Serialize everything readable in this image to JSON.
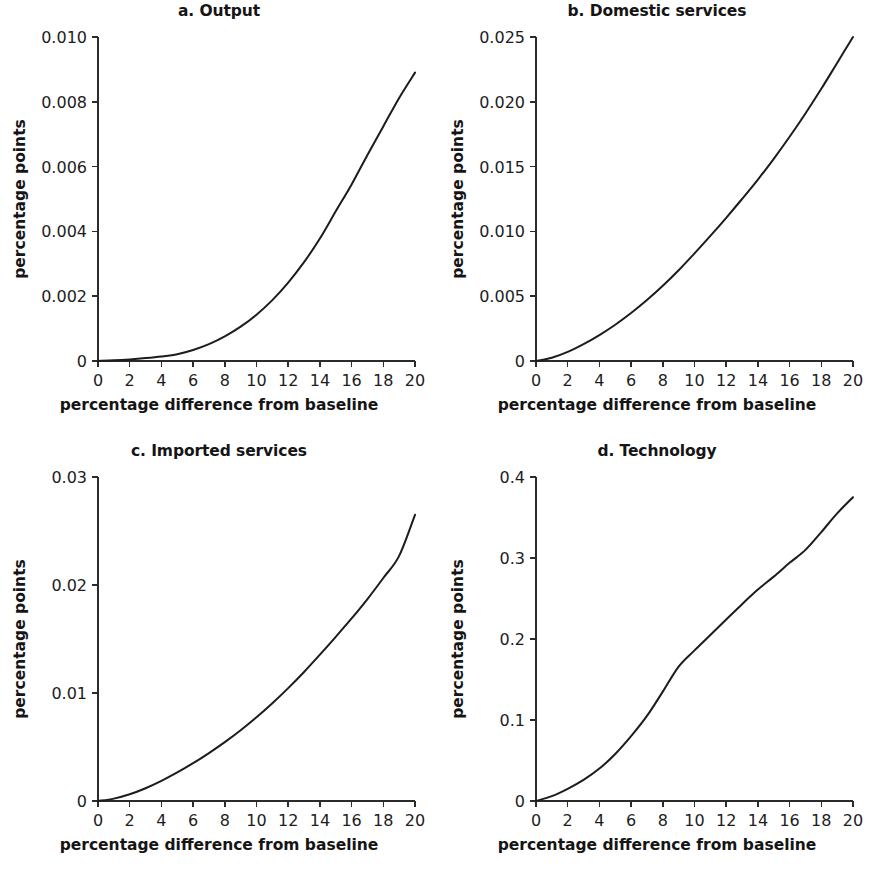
{
  "figure": {
    "background": "#ffffff",
    "line_color": "#1c1c1c",
    "axis_color": "#2b2b2b",
    "panel_count": 4
  },
  "chart_data": [
    {
      "type": "line",
      "title": "a. Output",
      "panel_letter": "a.",
      "panel_name": "Output",
      "xlabel": "percentage difference from baseline",
      "ylabel": "percentage points",
      "xlim": [
        0,
        20
      ],
      "ylim": [
        0,
        0.01
      ],
      "grid": false,
      "legend": "none",
      "xticks": [
        0,
        2,
        4,
        6,
        8,
        10,
        12,
        14,
        16,
        18,
        20
      ],
      "xticklabels": [
        "0",
        "2",
        "4",
        "6",
        "8",
        "10",
        "12",
        "14",
        "16",
        "18",
        "20"
      ],
      "yticks": [
        0,
        0.002,
        0.004,
        0.006,
        0.008,
        0.01
      ],
      "yticklabels": [
        "0",
        "0.002",
        "0.004",
        "0.006",
        "0.008",
        "0.010"
      ],
      "x": [
        0,
        1,
        2,
        3,
        4,
        5,
        6,
        7,
        8,
        9,
        10,
        11,
        12,
        13,
        14,
        15,
        16,
        17,
        18,
        19,
        20
      ],
      "values": [
        0,
        2e-05,
        5e-05,
        9e-05,
        0.00014,
        0.00021,
        0.00034,
        0.00052,
        0.00076,
        0.00106,
        0.00143,
        0.00188,
        0.00242,
        0.00305,
        0.00378,
        0.00462,
        0.00545,
        0.00636,
        0.00724,
        0.00812,
        0.0089
      ]
    },
    {
      "type": "line",
      "title": "b. Domestic services",
      "panel_letter": "b.",
      "panel_name": "Domestic services",
      "xlabel": "percentage difference from baseline",
      "ylabel": "percentage points",
      "xlim": [
        0,
        20
      ],
      "ylim": [
        0,
        0.025
      ],
      "grid": false,
      "legend": "none",
      "xticks": [
        0,
        2,
        4,
        6,
        8,
        10,
        12,
        14,
        16,
        18,
        20
      ],
      "xticklabels": [
        "0",
        "2",
        "4",
        "6",
        "8",
        "10",
        "12",
        "14",
        "16",
        "18",
        "20"
      ],
      "yticks": [
        0,
        0.005,
        0.01,
        0.015,
        0.02,
        0.025
      ],
      "yticklabels": [
        "0",
        "0.005",
        "0.010",
        "0.015",
        "0.020",
        "0.025"
      ],
      "x": [
        0,
        1,
        2,
        3,
        4,
        5,
        6,
        7,
        8,
        9,
        10,
        11,
        12,
        13,
        14,
        15,
        16,
        17,
        18,
        19,
        20
      ],
      "values": [
        0,
        0.00025,
        0.0007,
        0.0013,
        0.002,
        0.0028,
        0.0037,
        0.0047,
        0.0058,
        0.007,
        0.0083,
        0.00965,
        0.01105,
        0.0125,
        0.014,
        0.0156,
        0.0173,
        0.0191,
        0.021,
        0.023,
        0.025
      ]
    },
    {
      "type": "line",
      "title": "c. Imported services",
      "panel_letter": "c.",
      "panel_name": "Imported services",
      "xlabel": "percentage difference from baseline",
      "ylabel": "percentage points",
      "xlim": [
        0,
        20
      ],
      "ylim": [
        0,
        0.03
      ],
      "grid": false,
      "legend": "none",
      "xticks": [
        0,
        2,
        4,
        6,
        8,
        10,
        12,
        14,
        16,
        18,
        20
      ],
      "xticklabels": [
        "0",
        "2",
        "4",
        "6",
        "8",
        "10",
        "12",
        "14",
        "16",
        "18",
        "20"
      ],
      "yticks": [
        0,
        0.01,
        0.02,
        0.03
      ],
      "yticklabels": [
        "0",
        "0.01",
        "0.02",
        "0.03"
      ],
      "x": [
        0,
        1,
        2,
        3,
        4,
        5,
        6,
        7,
        8,
        9,
        10,
        11,
        12,
        13,
        14,
        15,
        16,
        17,
        18,
        19,
        20
      ],
      "values": [
        0,
        0.00022,
        0.00062,
        0.00118,
        0.00186,
        0.00264,
        0.0035,
        0.00444,
        0.00545,
        0.00655,
        0.00775,
        0.00905,
        0.01045,
        0.01195,
        0.01355,
        0.0152,
        0.0169,
        0.0187,
        0.02065,
        0.0227,
        0.0265
      ]
    },
    {
      "type": "line",
      "title": "d. Technology",
      "panel_letter": "d.",
      "panel_name": "Technology",
      "xlabel": "percentage difference from baseline",
      "ylabel": "percentage points",
      "xlim": [
        0,
        20
      ],
      "ylim": [
        0,
        0.4
      ],
      "grid": false,
      "legend": "none",
      "xticks": [
        0,
        2,
        4,
        6,
        8,
        10,
        12,
        14,
        16,
        18,
        20
      ],
      "xticklabels": [
        "0",
        "2",
        "4",
        "6",
        "8",
        "10",
        "12",
        "14",
        "16",
        "18",
        "20"
      ],
      "yticks": [
        0,
        0.1,
        0.2,
        0.3,
        0.4
      ],
      "yticklabels": [
        "0",
        "0.1",
        "0.2",
        "0.3",
        "0.4"
      ],
      "x": [
        0,
        1,
        2,
        3,
        4,
        5,
        6,
        7,
        8,
        9,
        10,
        11,
        12,
        13,
        14,
        15,
        16,
        17,
        18,
        19,
        20
      ],
      "values": [
        0,
        0.006,
        0.015,
        0.026,
        0.04,
        0.058,
        0.08,
        0.105,
        0.135,
        0.166,
        0.186,
        0.205,
        0.224,
        0.243,
        0.261,
        0.277,
        0.294,
        0.31,
        0.332,
        0.355,
        0.375
      ]
    }
  ]
}
